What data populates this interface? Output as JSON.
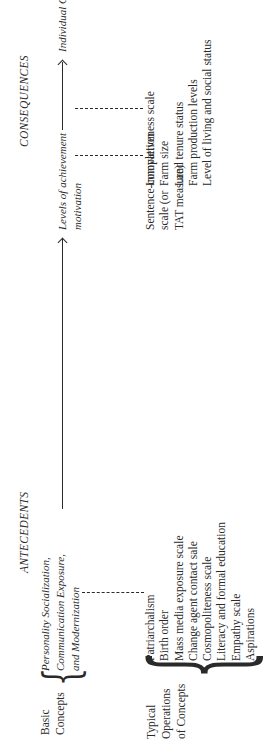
{
  "headers": {
    "antecedents": "ANTECEDENTS",
    "consequences": "CONSEQUENCES"
  },
  "row_labels": {
    "basic_concepts": [
      "Basic",
      "Concepts"
    ],
    "typical_operations": [
      "Typical",
      "Operations",
      "of Concepts"
    ]
  },
  "basic_concepts": {
    "antecedent": [
      "Personality Socialization,",
      "Communication Exposure,",
      "and Modernization"
    ],
    "intervening": [
      "Levels of achievement",
      "motivation"
    ],
    "consequence": [
      "Individual Occupational Excellence"
    ]
  },
  "operations": {
    "antecedent": [
      "Patriarchalism",
      "Birth order",
      "Mass media exposure scale",
      "Change agent contact sale",
      "Cosmopoliteness scale",
      "Literacy and formal education",
      "Empathy scale",
      "Aspirations"
    ],
    "intervening": [
      "Sentence-completion",
      "scale (or",
      "TAT measure)"
    ],
    "consequence": [
      "Innovativeness scale",
      "Farm size",
      "Land tenure status",
      "Farm production levels",
      "Level of living and social status"
    ]
  }
}
